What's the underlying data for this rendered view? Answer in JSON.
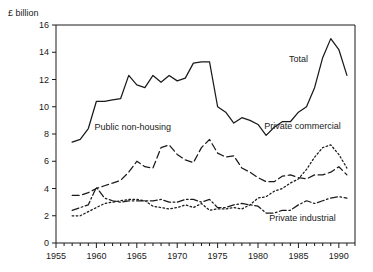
{
  "chart_data": {
    "type": "line",
    "title": "",
    "ylabel": "£ billion",
    "xlabel": "",
    "ylim": [
      0,
      16
    ],
    "xlim": [
      1955,
      1992
    ],
    "yticks": [
      0,
      2,
      4,
      6,
      8,
      10,
      12,
      14,
      16
    ],
    "ytick_labels": [
      "0",
      "2",
      "4",
      "6",
      "8",
      "10",
      "12",
      "14",
      "16"
    ],
    "xticks": [
      1955,
      1960,
      1965,
      1970,
      1975,
      1980,
      1985,
      1990
    ],
    "xtick_labels": [
      "1955",
      "1960",
      "1965",
      "1970",
      "1975",
      "1980",
      "1985",
      "1990"
    ],
    "minor_xtick_interval": 1,
    "grid": false,
    "legend_position": "inline-annotations",
    "x": [
      1957,
      1958,
      1959,
      1960,
      1961,
      1962,
      1963,
      1964,
      1965,
      1966,
      1967,
      1968,
      1969,
      1970,
      1971,
      1972,
      1973,
      1974,
      1975,
      1976,
      1977,
      1978,
      1979,
      1980,
      1981,
      1982,
      1983,
      1984,
      1985,
      1986,
      1987,
      1988,
      1989,
      1990,
      1991
    ],
    "series": [
      {
        "name": "Total",
        "label": "Total",
        "linestyle": "solid",
        "values": [
          7.4,
          7.6,
          8.4,
          10.4,
          10.4,
          10.5,
          10.6,
          12.3,
          11.6,
          11.4,
          12.3,
          11.8,
          12.3,
          11.9,
          12.1,
          13.2,
          13.3,
          13.3,
          10.0,
          9.6,
          8.8,
          9.2,
          9.0,
          8.7,
          7.9,
          8.5,
          8.9,
          8.9,
          9.6,
          10.0,
          11.4,
          13.6,
          15.0,
          14.2,
          12.3
        ]
      },
      {
        "name": "Public non-housing",
        "label": "Public non-housing",
        "linestyle": "dashed",
        "values": [
          3.5,
          3.5,
          3.7,
          4.0,
          4.2,
          4.4,
          4.6,
          5.2,
          6.0,
          5.6,
          5.5,
          7.0,
          7.2,
          6.5,
          6.1,
          5.9,
          7.0,
          7.6,
          6.6,
          6.3,
          6.4,
          5.5,
          5.2,
          4.8,
          4.5,
          4.5,
          4.9,
          5.0,
          4.8,
          4.7,
          5.0,
          5.0,
          5.2,
          5.6,
          5.0
        ]
      },
      {
        "name": "Private commercial",
        "label": "Private commercial",
        "linestyle": "dotted",
        "values": [
          2.0,
          2.0,
          2.3,
          2.6,
          2.9,
          3.0,
          3.1,
          3.2,
          3.2,
          3.1,
          2.7,
          2.6,
          2.5,
          2.6,
          2.8,
          2.6,
          2.9,
          2.4,
          2.5,
          2.5,
          2.6,
          2.5,
          2.8,
          3.3,
          3.4,
          3.8,
          4.0,
          4.4,
          4.7,
          5.4,
          6.3,
          7.0,
          7.2,
          6.5,
          5.5
        ]
      },
      {
        "name": "Private industrial",
        "label": "Private industrial",
        "linestyle": "dashdot",
        "values": [
          2.4,
          2.6,
          2.8,
          4.1,
          3.3,
          3.1,
          3.0,
          3.1,
          3.1,
          3.1,
          3.1,
          3.2,
          3.0,
          3.0,
          3.2,
          3.2,
          3.0,
          3.2,
          2.6,
          2.6,
          2.8,
          2.9,
          2.8,
          2.7,
          2.2,
          2.2,
          2.4,
          2.4,
          2.8,
          3.1,
          2.9,
          3.1,
          3.3,
          3.4,
          3.3
        ]
      }
    ],
    "annotations": [
      {
        "text": "Total",
        "x": 1985.0,
        "y": 13.3
      },
      {
        "text": "Public non-housing",
        "x": 1964.5,
        "y": 8.3
      },
      {
        "text": "Private commercial",
        "x": 1985.5,
        "y": 8.4
      },
      {
        "text": "Private industrial",
        "x": 1985.5,
        "y": 1.65
      }
    ],
    "colors": {
      "line": "#1a1a1a",
      "axis": "#1a1a1a",
      "background": "#ffffff"
    }
  }
}
